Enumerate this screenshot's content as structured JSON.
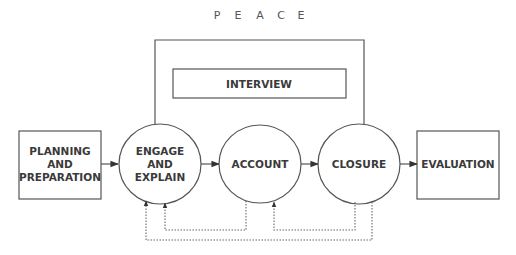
{
  "title": "P E A C E",
  "title_letters": [
    "P",
    "E",
    "A",
    "C",
    "E"
  ],
  "interview_label": "INTERVIEW",
  "nodes": [
    {
      "id": "planning",
      "shape": "box",
      "lines": [
        "PLANNING",
        "AND",
        "PREPARATION"
      ]
    },
    {
      "id": "engage",
      "shape": "circle",
      "lines": [
        "ENGAGE",
        "AND",
        "EXPLAIN"
      ]
    },
    {
      "id": "account",
      "shape": "circle",
      "lines": [
        "ACCOUNT"
      ]
    },
    {
      "id": "closure",
      "shape": "circle",
      "lines": [
        "CLOSURE"
      ]
    },
    {
      "id": "evaluation",
      "shape": "box",
      "lines": [
        "EVALUATION"
      ]
    }
  ],
  "edges": [
    {
      "from": "planning",
      "to": "engage",
      "style": "solid"
    },
    {
      "from": "engage",
      "to": "account",
      "style": "solid"
    },
    {
      "from": "account",
      "to": "closure",
      "style": "solid"
    },
    {
      "from": "closure",
      "to": "evaluation",
      "style": "solid"
    },
    {
      "from": "account",
      "to": "engage",
      "style": "dotted"
    },
    {
      "from": "closure",
      "to": "account",
      "style": "dotted"
    },
    {
      "from": "closure",
      "to": "engage",
      "style": "dotted"
    }
  ],
  "colors": {
    "line": "#555555",
    "text": "#3a3a3a"
  }
}
